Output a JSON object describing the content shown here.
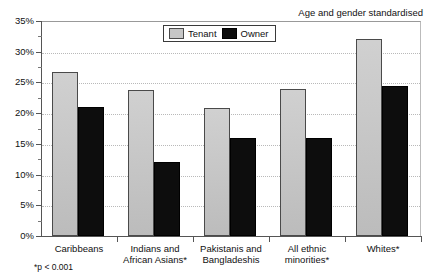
{
  "annotation": "Age and gender standardised",
  "footnote": "*p < 0.001",
  "top_artifact": "",
  "legend": {
    "tenant_label": "Tenant",
    "owner_label": "Owner"
  },
  "colors": {
    "tenant": "#c6c6c6",
    "owner": "#0d0d0d",
    "axis": "#555555",
    "gridline": "#b9b9b9"
  },
  "chart_data": {
    "type": "bar",
    "title": "",
    "subtitle": "",
    "xlabel": "",
    "ylabel": "",
    "ylim": [
      0,
      35
    ],
    "ytick_values": [
      0,
      5,
      10,
      15,
      20,
      25,
      30,
      35
    ],
    "ytick_labels": [
      "0%",
      "5%",
      "10%",
      "15%",
      "20%",
      "25%",
      "30%",
      "35%"
    ],
    "yminor_step": 2.5,
    "grid": true,
    "grid_axis": "y",
    "legend_position": "top-center",
    "annotations": [
      "Age and gender standardised",
      "*p < 0.001"
    ],
    "categories": [
      "Caribbeans",
      "Indians and\nAfrican Asians*",
      "Pakistanis and\nBangladeshis",
      "All ethnic minorities*",
      "Whites*"
    ],
    "series": [
      {
        "name": "Tenant",
        "color": "#c6c6c6",
        "values": [
          26.7,
          23.8,
          20.8,
          24.0,
          32.0
        ]
      },
      {
        "name": "Owner",
        "color": "#0d0d0d",
        "values": [
          21.0,
          12.0,
          16.0,
          16.0,
          24.5
        ]
      }
    ]
  }
}
